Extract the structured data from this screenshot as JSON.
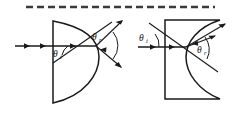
{
  "figure": {
    "background_color": "#ffffff",
    "ink_color": "#1a1a1a",
    "divider": {
      "name": "dashed-divider",
      "style": "dashed",
      "color": "#3a3a3a",
      "x_start": 26,
      "x_end": 215,
      "y": 7,
      "dash_length": 7,
      "dash_gap": 4,
      "thickness": 2.6
    },
    "panels": [
      {
        "id": "left",
        "name": "convex-interface-panel",
        "shape": "plano-convex-d-lens",
        "shape_description": "flat vertical left face with convex arc bulging to the right",
        "incident_ray": {
          "name": "incident-ray",
          "label": "",
          "direction": "horizontal-rightward",
          "arrow_count": 3
        },
        "normal_line": {
          "name": "surface-normal-line",
          "description": "diagonal construction line through the interface point"
        },
        "angle_incidence": {
          "name": "theta-i",
          "symbol": "θ",
          "subscript": "i",
          "text": "θi"
        },
        "angle_refraction": {
          "name": "theta-r",
          "symbol": "θ",
          "subscript": "r",
          "text": "θr"
        },
        "refracted_rays": [
          {
            "name": "refracted-ray-upper",
            "direction": "upper-right"
          },
          {
            "name": "refracted-ray-lower",
            "direction": "lower-right"
          }
        ]
      },
      {
        "id": "right",
        "name": "concave-interface-panel",
        "shape": "rectangle-with-concave-right-face",
        "shape_description": "rectangular block whose right face curves inward (concave)",
        "incident_ray": {
          "name": "incident-ray",
          "label": "",
          "direction": "horizontal-rightward",
          "arrow_count": 2
        },
        "normal_line": {
          "name": "surface-normal-line",
          "description": "diagonal construction line from upper-left to lower-right through the interface point"
        },
        "angle_incidence": {
          "name": "theta-i",
          "symbol": "θ",
          "subscript": "i",
          "text": "θi"
        },
        "angle_refraction": {
          "name": "theta-r",
          "symbol": "θ",
          "subscript": "r",
          "text": "θr"
        },
        "refracted_rays": [
          {
            "name": "refracted-ray-upper",
            "direction": "upper-right"
          },
          {
            "name": "refracted-ray-lower",
            "direction": "lower-right"
          }
        ]
      }
    ],
    "labels": {
      "theta": "θ",
      "sub_i": "i",
      "sub_r": "r"
    }
  }
}
